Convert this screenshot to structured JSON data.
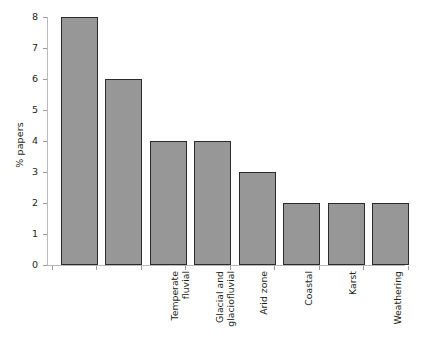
{
  "chart_data": {
    "type": "bar",
    "title": "",
    "xlabel": "",
    "ylabel": "% papers",
    "categories": [
      "Temperate\nfluvial",
      "Glacial and\nglaciofluvial",
      "Arid zone",
      "Coastal",
      "Karst",
      "Weathering",
      "Mass-movement",
      "Other"
    ],
    "values": [
      8,
      6,
      4,
      4,
      3,
      2,
      2,
      2
    ],
    "ylim": [
      0,
      8
    ],
    "yticks": [
      0,
      1,
      2,
      3,
      4,
      5,
      6,
      7,
      8
    ],
    "ytick_labels": [
      "0",
      "1",
      "2",
      "3",
      "4",
      "5",
      "6",
      "7",
      "8"
    ],
    "grid": false,
    "legend": false,
    "bar_fill_color": "#979797",
    "bar_edge_color": "#2b2b2b",
    "axis_color": "#b9b9b9",
    "text_color": "#231f20",
    "background_color": "#ffffff"
  }
}
